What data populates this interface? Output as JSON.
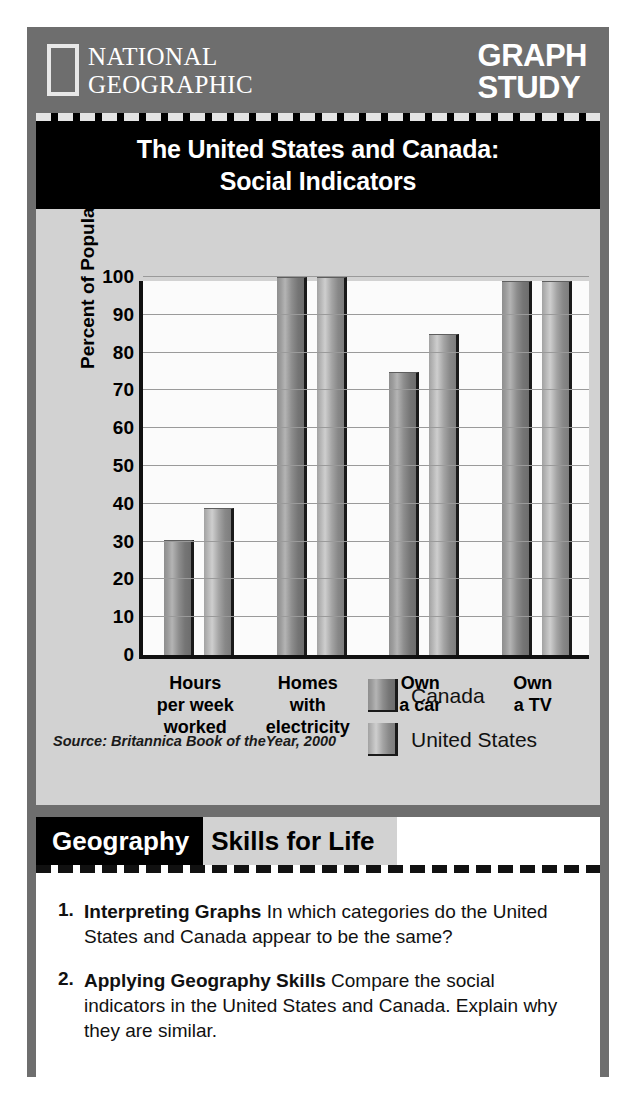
{
  "header": {
    "brand_line1": "NATIONAL",
    "brand_line2": "GEOGRAPHIC",
    "feature_line1": "GRAPH",
    "feature_line2": "STUDY"
  },
  "title": {
    "line1": "The United States and Canada:",
    "line2": "Social Indicators"
  },
  "source": "Source: Britannica Book of theYear, 2000",
  "legend": {
    "canada": "Canada",
    "united_states": "United States"
  },
  "geography_band": {
    "black_label": "Geography",
    "gray_label": "Skills for Life"
  },
  "questions": [
    {
      "number": "1.",
      "lead": "Interpreting Graphs",
      "text": " In which categories do the United States and Canada appear to be the same?"
    },
    {
      "number": "2.",
      "lead": "Applying Geography Skills",
      "text": " Compare the social indicators in the United States and Canada. Explain why they are similar."
    }
  ],
  "chart_data": {
    "type": "bar",
    "title": "The United States and Canada: Social Indicators",
    "xlabel": "",
    "ylabel": "Percent of Population",
    "ylim": [
      0,
      100
    ],
    "yticks": [
      0,
      10,
      20,
      30,
      40,
      50,
      60,
      70,
      80,
      90,
      100
    ],
    "grid": true,
    "legend_position": "bottom-right",
    "categories": [
      "Hours\nper week\nworked",
      "Homes\nwith\nelectricity",
      "Own\na car",
      "Own\na TV"
    ],
    "category_lines": [
      [
        "Hours",
        "per week",
        "worked"
      ],
      [
        "Homes",
        "with",
        "electricity"
      ],
      [
        "Own",
        "a car",
        ""
      ],
      [
        "Own",
        "a TV",
        ""
      ]
    ],
    "series": [
      {
        "name": "Canada",
        "color": "#8d8d8d",
        "values": [
          30.5,
          100,
          75,
          99
        ]
      },
      {
        "name": "United States",
        "color": "#b0b0b0",
        "values": [
          39,
          100,
          85,
          99
        ]
      }
    ]
  }
}
